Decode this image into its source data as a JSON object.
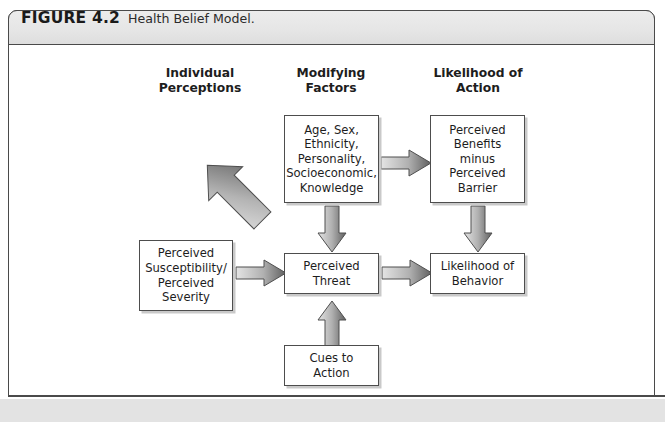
{
  "figure": {
    "label": "FIGURE 4.2",
    "caption": "Health Belief Model."
  },
  "columns": [
    {
      "name": "individual-perceptions",
      "label": "Individual\nPerceptions"
    },
    {
      "name": "modifying-factors",
      "label": "Modifying\nFactors"
    },
    {
      "name": "likelihood-of-action",
      "label": "Likelihood of\nAction"
    }
  ],
  "nodes": [
    {
      "id": "demographics",
      "label": "Age, Sex,\nEthnicity,\nPersonality,\nSocioeconomic,\nKnowledge"
    },
    {
      "id": "benefits-minus-barrier",
      "label": "Perceived\nBenefits\nminus\nPerceived\nBarrier"
    },
    {
      "id": "susceptibility-severity",
      "label": "Perceived\nSusceptibility/\nPerceived\nSeverity"
    },
    {
      "id": "perceived-threat",
      "label": "Perceived\nThreat"
    },
    {
      "id": "likelihood-of-behavior",
      "label": "Likelihood of\nBehavior"
    },
    {
      "id": "cues-to-action",
      "label": "Cues to\nAction"
    }
  ],
  "arrows": [
    {
      "id": "demographics-to-benefits",
      "direction": "right"
    },
    {
      "id": "demographics-to-susceptibility",
      "direction": "diagonal-down-left"
    },
    {
      "id": "demographics-to-threat",
      "direction": "down"
    },
    {
      "id": "benefits-to-likelihood",
      "direction": "down"
    },
    {
      "id": "susceptibility-to-threat",
      "direction": "right"
    },
    {
      "id": "threat-to-likelihood",
      "direction": "right"
    },
    {
      "id": "cues-to-threat",
      "direction": "up"
    }
  ],
  "colors": {
    "frame_border": "#4a4a4a",
    "header_fill": "#e6e6e6",
    "box_border": "#4d4d4d",
    "box_shadow": "#c9c9c9",
    "arrow_light": "#d8d8d8",
    "arrow_dark": "#6e6e6e",
    "band": "#e3e3e3",
    "text": "#1d1d1d"
  }
}
